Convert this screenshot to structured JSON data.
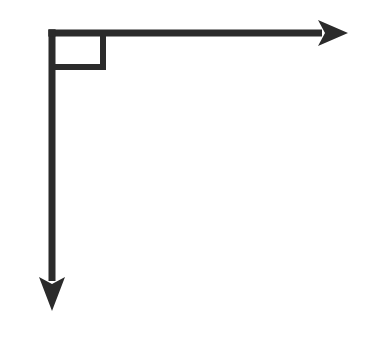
{
  "figure": {
    "title": "Right angle formed by two perpendicular rays",
    "background_color": "#ffffff",
    "stroke_color": "#2b2b2b",
    "stroke_width": 7,
    "canvas": {
      "width": 373,
      "height": 338
    },
    "vertex": {
      "label": "vertex",
      "x": 52,
      "y": 33
    },
    "angle": {
      "measure_degrees": 90,
      "type": "right angle",
      "marker_shape": "square",
      "marker_stroke_width": 6,
      "marker": {
        "x": 52,
        "y": 33,
        "width": 51,
        "height": 34
      }
    },
    "rays": [
      {
        "name": "horizontal-ray",
        "direction": "right",
        "start_x": 52,
        "start_y": 33,
        "end_x": 348,
        "end_y": 33,
        "length": 296,
        "has_arrowhead": true,
        "arrowhead": {
          "tip_x": 348,
          "tip_y": 33,
          "back_x": 318,
          "half_width": 13,
          "notch_depth": 7
        }
      },
      {
        "name": "vertical-ray",
        "direction": "down",
        "start_x": 52,
        "start_y": 33,
        "end_x": 52,
        "end_y": 311,
        "length": 278,
        "has_arrowhead": true,
        "arrowhead": {
          "tip_x": 52,
          "tip_y": 311,
          "back_y": 277,
          "half_width": 13,
          "notch_depth": 7
        }
      }
    ]
  }
}
